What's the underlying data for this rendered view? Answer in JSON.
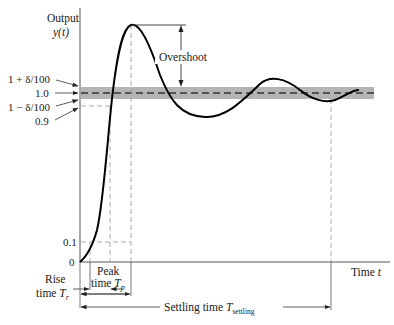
{
  "figure": {
    "type": "step-response-diagram",
    "y_axis": {
      "title_line1": "Output",
      "title_line2": "y(t)"
    },
    "x_axis": {
      "title": "Time t"
    },
    "y_labels": {
      "upper_band": "1 + δ/100",
      "one": "1.0",
      "lower_band": "1 − δ/100",
      "p90": "0.9",
      "p10": "0.1",
      "zero": "0"
    },
    "annotations": {
      "overshoot": "Overshoot",
      "rise_time_line1": "Rise",
      "rise_time_line2": "time T",
      "rise_time_sub": "r",
      "peak_time_line1": "Peak",
      "peak_time_line2": "time T",
      "peak_time_sub": "p",
      "settling_time": "Settling time T",
      "settling_time_sub": "settling"
    },
    "colors": {
      "curve": "#000000",
      "band": "#b4b4b4",
      "axis": "#4a4a4a",
      "guide": "#9a9a9a"
    }
  },
  "chart_data": {
    "type": "line",
    "title": "",
    "xlabel": "Time t",
    "ylabel": "Output y(t)",
    "y_ticks": [
      "0",
      "0.1",
      "0.9",
      "1 − δ/100",
      "1.0",
      "1 + δ/100"
    ],
    "series": [
      {
        "name": "y(t) underdamped step response",
        "x": [
          0,
          0.05,
          0.1,
          0.15,
          0.2,
          0.25,
          0.3,
          0.4,
          0.5,
          0.6,
          0.7,
          0.8,
          0.9,
          1.0
        ],
        "values": [
          0,
          0.1,
          0.5,
          0.9,
          1.29,
          1.25,
          1.05,
          0.86,
          0.96,
          1.12,
          1.0,
          0.94,
          0.97,
          1.01
        ]
      }
    ],
    "markers": {
      "rise_time_interval": "0.1 to 0.9 of final value",
      "peak": "maximum of y(t) at T_p",
      "settling_band": "1 ± δ/100",
      "final_value": 1.0
    },
    "grid": false,
    "legend": "none"
  }
}
